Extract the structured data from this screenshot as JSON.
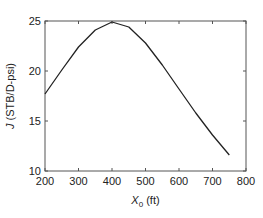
{
  "chart_data": {
    "type": "line",
    "title": "",
    "xlabel": "X0 (ft)",
    "xlabel_parts": {
      "main": "X",
      "sub": "0",
      "unit": " (ft)"
    },
    "ylabel": "J (STB/D-psi)",
    "ylabel_parts": {
      "italic": "J",
      "rest": " (STB/D-psi)"
    },
    "xlim": [
      200,
      800
    ],
    "ylim": [
      10,
      25
    ],
    "xticks": [
      200,
      300,
      400,
      500,
      600,
      700,
      800
    ],
    "yticks": [
      10,
      15,
      20,
      25
    ],
    "grid": false,
    "legend": null,
    "series": [
      {
        "name": "J",
        "color": "#222222",
        "x": [
          200,
          250,
          300,
          350,
          400,
          450,
          500,
          550,
          600,
          650,
          700,
          750
        ],
        "y": [
          17.7,
          20.1,
          22.4,
          24.1,
          24.9,
          24.4,
          22.8,
          20.6,
          18.2,
          15.8,
          13.6,
          11.6
        ]
      }
    ]
  }
}
